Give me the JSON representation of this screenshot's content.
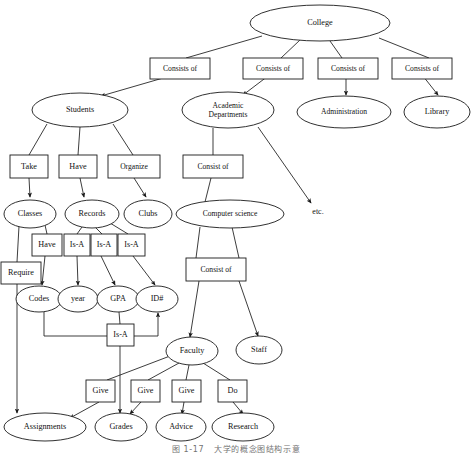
{
  "figure": {
    "type": "concept-map",
    "caption_number": "图 1-17",
    "caption_text": "大学的概念图结构示意",
    "colors": {
      "stroke": "#1a1a1a",
      "fill": "#ffffff",
      "text": "#111111"
    }
  },
  "free_text": [
    {
      "id": "etc",
      "label": "etc.",
      "x": 318,
      "y": 212
    }
  ],
  "nodes": [
    {
      "id": "college",
      "kind": "ellipse",
      "label": "College",
      "cx": 320,
      "cy": 23,
      "rx": 70,
      "ry": 18
    },
    {
      "id": "students",
      "kind": "ellipse",
      "label": "Students",
      "cx": 80,
      "cy": 110,
      "rx": 48,
      "ry": 17
    },
    {
      "id": "acad_dept",
      "kind": "ellipse",
      "label": "Academic\nDepartments",
      "cx": 228,
      "cy": 110,
      "rx": 46,
      "ry": 18
    },
    {
      "id": "administration",
      "kind": "ellipse",
      "label": "Administration",
      "cx": 344,
      "cy": 112,
      "rx": 47,
      "ry": 16
    },
    {
      "id": "library",
      "kind": "ellipse",
      "label": "Library",
      "cx": 437,
      "cy": 112,
      "rx": 33,
      "ry": 16
    },
    {
      "id": "take",
      "kind": "rect",
      "label": "Take",
      "x": 10,
      "y": 155,
      "w": 38,
      "h": 23
    },
    {
      "id": "have1",
      "kind": "rect",
      "label": "Have",
      "x": 59,
      "y": 155,
      "w": 38,
      "h": 23
    },
    {
      "id": "organize",
      "kind": "rect",
      "label": "Organize",
      "x": 108,
      "y": 155,
      "w": 52,
      "h": 23
    },
    {
      "id": "consist1",
      "kind": "rect",
      "label": "Consist of",
      "x": 183,
      "y": 155,
      "w": 60,
      "h": 23
    },
    {
      "id": "classes",
      "kind": "ellipse",
      "label": "Classes",
      "cx": 30,
      "cy": 214,
      "rx": 26,
      "ry": 14
    },
    {
      "id": "records",
      "kind": "ellipse",
      "label": "Records",
      "cx": 92,
      "cy": 214,
      "rx": 27,
      "ry": 14
    },
    {
      "id": "clubs",
      "kind": "ellipse",
      "label": "Clubs",
      "cx": 148,
      "cy": 214,
      "rx": 24,
      "ry": 14
    },
    {
      "id": "compsci",
      "kind": "ellipse",
      "label": "Computer science",
      "cx": 230,
      "cy": 214,
      "rx": 54,
      "ry": 14
    },
    {
      "id": "have2",
      "kind": "rect",
      "label": "Have",
      "x": 32,
      "y": 234,
      "w": 30,
      "h": 22
    },
    {
      "id": "isa1",
      "kind": "rect",
      "label": "Is-A",
      "x": 64,
      "y": 234,
      "w": 26,
      "h": 22
    },
    {
      "id": "isa2",
      "kind": "rect",
      "label": "Is-A",
      "x": 91,
      "y": 234,
      "w": 26,
      "h": 22
    },
    {
      "id": "isa3",
      "kind": "rect",
      "label": "Is-A",
      "x": 118,
      "y": 234,
      "w": 27,
      "h": 22
    },
    {
      "id": "require",
      "kind": "rect",
      "label": "Require",
      "x": 1,
      "y": 262,
      "w": 40,
      "h": 22
    },
    {
      "id": "consist2",
      "kind": "rect",
      "label": "Consist of",
      "x": 186,
      "y": 258,
      "w": 60,
      "h": 23
    },
    {
      "id": "codes",
      "kind": "ellipse",
      "label": "Codes",
      "cx": 39,
      "cy": 299,
      "rx": 23,
      "ry": 13
    },
    {
      "id": "year",
      "kind": "ellipse",
      "label": "year",
      "cx": 78,
      "cy": 299,
      "rx": 20,
      "ry": 13
    },
    {
      "id": "gpa",
      "kind": "ellipse",
      "label": "GPA",
      "cx": 118,
      "cy": 299,
      "rx": 21,
      "ry": 13
    },
    {
      "id": "idnum",
      "kind": "ellipse",
      "label": "ID#",
      "cx": 157,
      "cy": 299,
      "rx": 21,
      "ry": 13
    },
    {
      "id": "isa4",
      "kind": "rect",
      "label": "Is-A",
      "x": 107,
      "y": 324,
      "w": 27,
      "h": 22
    },
    {
      "id": "faculty",
      "kind": "ellipse",
      "label": "Faculty",
      "cx": 192,
      "cy": 351,
      "rx": 26,
      "ry": 14
    },
    {
      "id": "staff",
      "kind": "ellipse",
      "label": "Staff",
      "cx": 259,
      "cy": 350,
      "rx": 23,
      "ry": 14
    },
    {
      "id": "give1",
      "kind": "rect",
      "label": "Give",
      "x": 86,
      "y": 380,
      "w": 29,
      "h": 22
    },
    {
      "id": "give2",
      "kind": "rect",
      "label": "Give",
      "x": 131,
      "y": 380,
      "w": 29,
      "h": 22
    },
    {
      "id": "give3",
      "kind": "rect",
      "label": "Give",
      "x": 172,
      "y": 380,
      "w": 29,
      "h": 22
    },
    {
      "id": "do",
      "kind": "rect",
      "label": "Do",
      "x": 218,
      "y": 380,
      "w": 29,
      "h": 22
    },
    {
      "id": "assignments",
      "kind": "ellipse",
      "label": "Assignments",
      "cx": 45,
      "cy": 427,
      "rx": 41,
      "ry": 14
    },
    {
      "id": "grades",
      "kind": "ellipse",
      "label": "Grades",
      "cx": 121,
      "cy": 427,
      "rx": 26,
      "ry": 14
    },
    {
      "id": "advice",
      "kind": "ellipse",
      "label": "Advice",
      "cx": 181,
      "cy": 427,
      "rx": 25,
      "ry": 14
    },
    {
      "id": "research",
      "kind": "ellipse",
      "label": "Research",
      "cx": 243,
      "cy": 427,
      "rx": 31,
      "ry": 14
    }
  ],
  "edges": [
    {
      "from": "college",
      "to": "consists1",
      "path": "M 262,36 L 186,58",
      "arrow": false
    },
    {
      "from": "college",
      "to": "consists2",
      "path": "M 300,40 L 281,58",
      "arrow": false
    },
    {
      "from": "college",
      "to": "consists3",
      "path": "M 330,41 L 342,58",
      "arrow": false
    },
    {
      "from": "college",
      "to": "consists4",
      "path": "M 379,38 L 429,58",
      "arrow": false
    },
    {
      "from": "consists1",
      "to": "students",
      "path": "M 170,76 L 101,96",
      "arrow": true
    },
    {
      "from": "consists2",
      "to": "acad_dept",
      "path": "M 268,76 L 243,95",
      "arrow": true
    },
    {
      "from": "consists3",
      "to": "administration",
      "path": "M 346,76 L 346,95",
      "arrow": true
    },
    {
      "from": "consists4",
      "to": "library",
      "path": "M 423,76 L 438,95",
      "arrow": true
    },
    {
      "from": "students",
      "to": "take",
      "path": "M 47,124 L 29,155",
      "arrow": false
    },
    {
      "from": "students",
      "to": "have1",
      "path": "M 80,127 L 78,155",
      "arrow": false
    },
    {
      "from": "students",
      "to": "organize",
      "path": "M 113,124 L 133,155",
      "arrow": false
    },
    {
      "from": "acad_dept",
      "to": "consist1",
      "path": "M 213,128 L 213,155",
      "arrow": false
    },
    {
      "from": "acad_dept",
      "to": "etc",
      "path": "M 258,127 L 311,203",
      "arrow": true
    },
    {
      "from": "take",
      "to": "classes",
      "path": "M 29,178 L 30,197",
      "arrow": true
    },
    {
      "from": "have1",
      "to": "records",
      "path": "M 80,178 L 84,197",
      "arrow": true
    },
    {
      "from": "organize",
      "to": "clubs",
      "path": "M 134,178 L 146,197",
      "arrow": true
    },
    {
      "from": "consist1",
      "to": "compsci",
      "path": "M 211,178 L 205,202",
      "arrow": false
    },
    {
      "from": "classes",
      "to": "have2",
      "path": "M 45,225 L 47,234",
      "arrow": false
    },
    {
      "from": "records",
      "to": "isa1",
      "path": "M 82,227 L 77,234",
      "arrow": false
    },
    {
      "from": "records",
      "to": "isa2",
      "path": "M 95,227 L 102,234",
      "arrow": false
    },
    {
      "from": "records",
      "to": "isa3",
      "path": "M 110,223 L 128,234",
      "arrow": false
    },
    {
      "from": "classes",
      "to": "require",
      "path": "M 19,226 L 17,262",
      "arrow": false
    },
    {
      "from": "have2",
      "to": "codes",
      "path": "M 45,256 L 42,285",
      "arrow": true
    },
    {
      "from": "isa1",
      "to": "year",
      "path": "M 77,256 L 78,285",
      "arrow": true
    },
    {
      "from": "isa2",
      "to": "gpa",
      "path": "M 101,256 L 115,285",
      "arrow": true
    },
    {
      "from": "isa3",
      "to": "idnum",
      "path": "M 133,256 L 155,285",
      "arrow": true
    },
    {
      "from": "require",
      "to": "assignments",
      "path": "M 17,284 L 17,413",
      "arrow": true
    },
    {
      "from": "compsci",
      "to": "consist2",
      "path": "M 200,227 L 196,258",
      "arrow": false
    },
    {
      "from": "compsci",
      "to": "consist2b",
      "path": "M 232,227 L 239,258",
      "arrow": false
    },
    {
      "from": "consist2",
      "to": "faculty",
      "path": "M 199,281 L 190,337",
      "arrow": true
    },
    {
      "from": "consist2",
      "to": "staff",
      "path": "M 239,281 L 258,336",
      "arrow": true
    },
    {
      "from": "codes",
      "to": "isa4",
      "path": "M 44,311 L 44,336 L 107,336",
      "arrow": false
    },
    {
      "from": "gpa",
      "to": "isa4",
      "path": "M 119,312 L 120,324",
      "arrow": false
    },
    {
      "from": "isa4",
      "to": "idnum",
      "path": "M 134,336 L 158,336 L 158,313",
      "arrow": true
    },
    {
      "from": "isa4",
      "to": "grades",
      "path": "M 120,346 L 120,413",
      "arrow": true
    },
    {
      "from": "faculty",
      "to": "give1",
      "path": "M 170,356 L 107,380",
      "arrow": false
    },
    {
      "from": "faculty",
      "to": "give2",
      "path": "M 179,363 L 148,380",
      "arrow": false
    },
    {
      "from": "faculty",
      "to": "give3",
      "path": "M 189,365 L 186,380",
      "arrow": false
    },
    {
      "from": "faculty",
      "to": "do",
      "path": "M 203,363 L 230,380",
      "arrow": false
    },
    {
      "from": "give1",
      "to": "assignments",
      "path": "M 99,402 L 70,418",
      "arrow": true
    },
    {
      "from": "give2",
      "to": "grades",
      "path": "M 141,402 L 130,414",
      "arrow": true
    },
    {
      "from": "give3",
      "to": "advice",
      "path": "M 184,402 L 182,414",
      "arrow": true
    },
    {
      "from": "do",
      "to": "research",
      "path": "M 233,402 L 243,414",
      "arrow": true
    }
  ],
  "relation_boxes": [
    {
      "id": "consists1",
      "label": "Consists of",
      "x": 150,
      "y": 58,
      "w": 60,
      "h": 21
    },
    {
      "id": "consists2",
      "label": "Consists of",
      "x": 243,
      "y": 58,
      "w": 60,
      "h": 21
    },
    {
      "id": "consists3",
      "label": "Consists of",
      "x": 318,
      "y": 58,
      "w": 60,
      "h": 21
    },
    {
      "id": "consists4",
      "label": "Consists of",
      "x": 392,
      "y": 58,
      "w": 60,
      "h": 21
    }
  ]
}
